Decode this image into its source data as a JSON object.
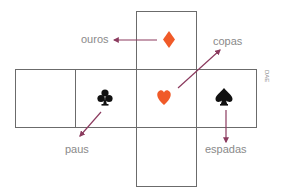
{
  "diagram": {
    "type": "cube-net",
    "faces": [
      {
        "id": "top",
        "suit": "diamond",
        "symbol": "♦",
        "color": "#f05a28"
      },
      {
        "id": "left-blank",
        "suit": "",
        "symbol": ""
      },
      {
        "id": "left",
        "suit": "club",
        "symbol": "♣",
        "color": "#111111"
      },
      {
        "id": "center",
        "suit": "heart",
        "symbol": "♥",
        "color": "#f05a28"
      },
      {
        "id": "right",
        "suit": "spade",
        "symbol": "♠",
        "color": "#111111"
      },
      {
        "id": "bottom",
        "suit": "",
        "symbol": ""
      }
    ],
    "labels": {
      "ouros": "ouros",
      "copas": "copas",
      "paus": "paus",
      "espadas": "espadas"
    },
    "credit": "DAE",
    "colors": {
      "line": "#6b6b6b",
      "arrow": "#8b3a5e",
      "label": "#8a8a8a",
      "red_suit": "#f05a28",
      "black_suit": "#111111"
    }
  }
}
